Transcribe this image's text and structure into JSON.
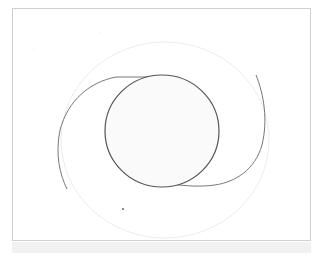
{
  "drawing": {
    "description": "Line sketch of a circle with two spiral arms inside a faint outer ellipse",
    "colors": {
      "frame_border": "#cfcfcf",
      "bottom_strip": "#f1f1f1",
      "inner_circle_stroke": "#555555",
      "spiral_arm_stroke": "#777777",
      "outer_ellipse_stroke": "#ececec",
      "inner_circle_fill": "#fafafa"
    },
    "inner_circle": {
      "cx": 162,
      "cy": 131,
      "rx": 57,
      "ry": 56
    },
    "outer_ellipse": {
      "cx": 165,
      "cy": 140,
      "rx": 104,
      "ry": 98
    }
  }
}
